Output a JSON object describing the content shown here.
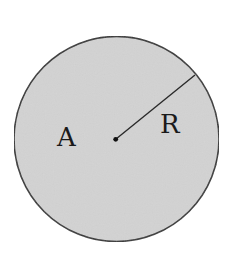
{
  "diagram": {
    "title": "",
    "shape": "circle",
    "colors": {
      "background": "#ffffff",
      "fill": "#d3d3d3",
      "stroke": "#333333",
      "label": "#1a1a1a"
    },
    "circle": {
      "cx": 116.5,
      "cy": 139,
      "r": 102.5
    },
    "center_dot": {
      "cx": 115.7,
      "cy": 139.3,
      "r": 2.4
    },
    "radius_line": {
      "x1": 115.7,
      "y1": 139.3,
      "x2": 195,
      "y2": 75
    },
    "labels": {
      "area": {
        "text": "A",
        "x": 58,
        "y": 146
      },
      "radius": {
        "text": "R",
        "x": 161,
        "y": 133
      }
    }
  }
}
